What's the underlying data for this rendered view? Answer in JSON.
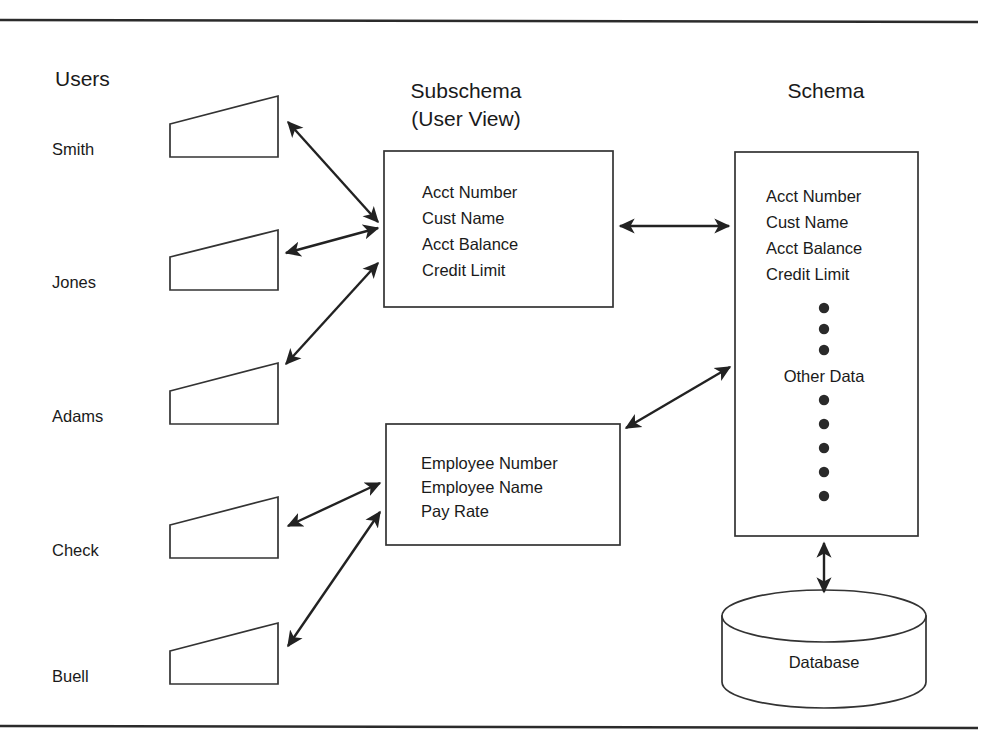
{
  "figure": {
    "title_users": "Users",
    "title_subschema_line1": "Subschema",
    "title_subschema_line2": "(User View)",
    "title_schema": "Schema"
  },
  "users": [
    {
      "name": "Smith"
    },
    {
      "name": "Jones"
    },
    {
      "name": "Adams"
    },
    {
      "name": "Check"
    },
    {
      "name": "Buell"
    }
  ],
  "subschema_box": {
    "fields": [
      "Acct Number",
      "Cust Name",
      "Acct Balance",
      "Credit Limit"
    ]
  },
  "employee_box": {
    "fields": [
      "Employee Number",
      "Employee Name",
      "Pay Rate"
    ]
  },
  "schema_box": {
    "fields": [
      "Acct Number",
      "Cust Name",
      "Acct Balance",
      "Credit Limit"
    ],
    "dots_above_label": 3,
    "middle_label": "Other Data",
    "dots_below_label": 5
  },
  "database": {
    "label": "Database"
  },
  "colors": {
    "stroke": "#333333",
    "rule": "#2b2b2b",
    "text": "#1a1a1a",
    "background": "#ffffff"
  }
}
